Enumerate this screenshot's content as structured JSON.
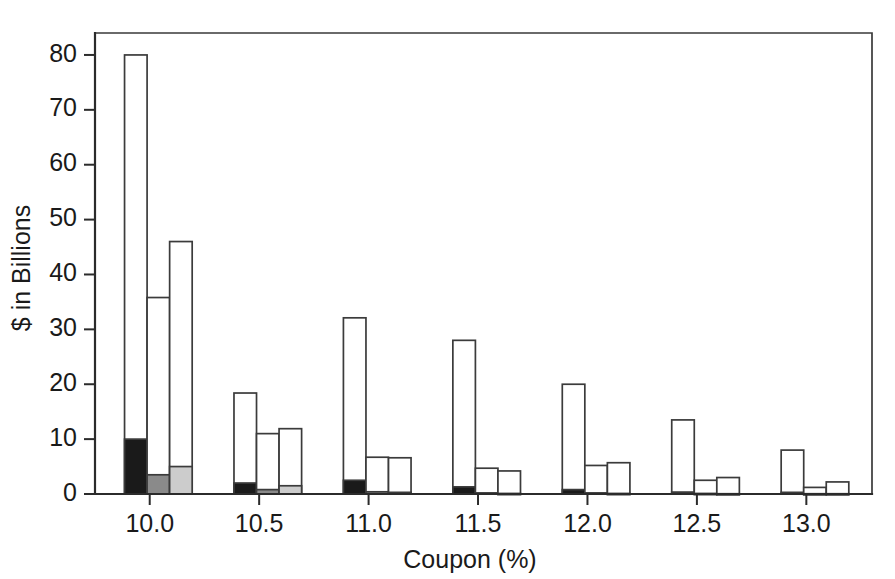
{
  "chart_data": {
    "type": "bar",
    "title": "",
    "subtitle": "",
    "xlabel": "Coupon (%)",
    "ylabel": "$ in Billions",
    "xlim": [
      9.75,
      13.3
    ],
    "ylim": [
      0,
      84
    ],
    "ytick_values": [
      0,
      10,
      20,
      30,
      40,
      50,
      60,
      70,
      80
    ],
    "ytick_labels": [
      "0",
      "10",
      "20",
      "30",
      "40",
      "50",
      "60",
      "70",
      "80"
    ],
    "xtick_values": [
      10.0,
      10.5,
      11.0,
      11.5,
      12.0,
      12.5,
      13.0
    ],
    "xtick_labels": [
      "10.0",
      "10.5",
      "11.0",
      "11.5",
      "12.0",
      "12.5",
      "13.0"
    ],
    "grid": false,
    "legend": "none",
    "categories": [
      "10.0",
      "10.5",
      "11.0",
      "11.5",
      "12.0",
      "12.5",
      "13.0"
    ],
    "stacked": true,
    "bars_per_group": 3,
    "series": [
      {
        "name": "filled-base",
        "fill_style": [
          "black",
          "dark-gray",
          "light-gray"
        ],
        "values": [
          [
            10.0,
            3.5,
            5.0
          ],
          [
            2.0,
            0.8,
            1.5
          ],
          [
            2.5,
            0.4,
            0.3
          ],
          [
            1.3,
            0.2,
            0.1
          ],
          [
            0.8,
            0.2,
            0.1
          ],
          [
            0.35,
            0.1,
            0.05
          ],
          [
            0.3,
            0.05,
            0.05
          ]
        ]
      },
      {
        "name": "total",
        "fill_style": [
          "white",
          "white",
          "white"
        ],
        "values": [
          [
            80.0,
            35.8,
            46.0
          ],
          [
            18.4,
            11.0,
            11.9
          ],
          [
            32.1,
            6.7,
            6.6
          ],
          [
            28.0,
            4.7,
            4.2
          ],
          [
            20.0,
            5.2,
            5.7
          ],
          [
            13.5,
            2.5,
            3.0
          ],
          [
            8.0,
            1.2,
            2.2
          ]
        ]
      }
    ]
  },
  "colors": {
    "black_fill": "#1a1a1a",
    "dark_gray_fill": "#8a8a8a",
    "light_gray_fill": "#cccccc",
    "white_fill": "#ffffff",
    "outline": "#3b3b3b",
    "axis": "#2b2b2b",
    "background": "#ffffff"
  }
}
